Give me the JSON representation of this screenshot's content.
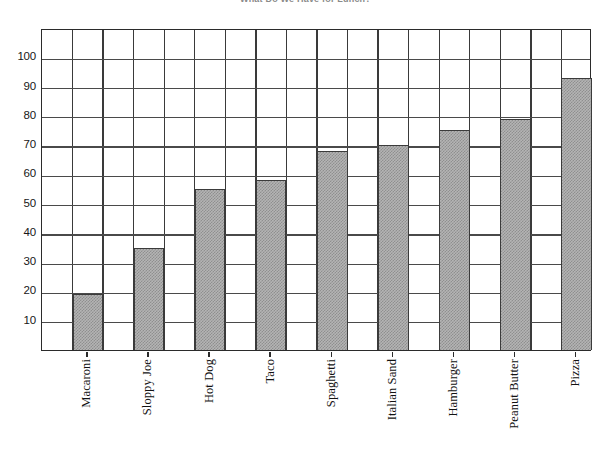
{
  "chart_data": {
    "type": "bar",
    "title": "What Do We Have for Lunch?",
    "xlabel": "",
    "ylabel": "",
    "ylim": [
      0,
      110
    ],
    "grid": true,
    "legend": "none",
    "categories": [
      "Macaroni",
      "Sloppy Joe",
      "Hot Dog",
      "Taco",
      "Spaghetti",
      "Italian Sand",
      "Hamburger",
      "Peanut Butter",
      "Pizza"
    ],
    "values": [
      19,
      35,
      55,
      58,
      68,
      70,
      75,
      79,
      93
    ],
    "ytick_labels": [
      "10",
      "20",
      "30",
      "40",
      "50",
      "60",
      "70",
      "80",
      "90",
      "100"
    ],
    "ytick_values": [
      10,
      20,
      30,
      40,
      50,
      60,
      70,
      80,
      90,
      100
    ],
    "series": [
      {
        "name": "Votes",
        "values": [
          19,
          35,
          55,
          58,
          68,
          70,
          75,
          79,
          93
        ]
      }
    ],
    "bar_fill_color": "#b4b4b4",
    "bar_edge_color": "#3b3b3b",
    "grid_color": "#4a4a4a",
    "axis_color": "#2b2b2b",
    "background_color": "#ffffff"
  }
}
